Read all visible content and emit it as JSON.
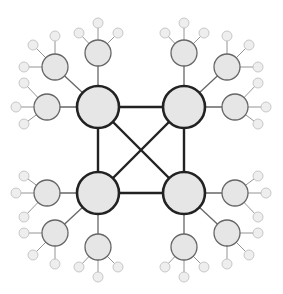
{
  "diagram": {
    "type": "hierarchical-network",
    "colors": {
      "background": "#ffffff",
      "node_fill": "#e6e6e6",
      "hub_stroke": "#222222",
      "satellite_stroke": "#666666",
      "leaf_stroke": "#bbbbbb",
      "leaf_fill": "#eeeeee"
    },
    "hubs": [
      {
        "id": "hub-tl",
        "x": 98,
        "y": 107
      },
      {
        "id": "hub-tr",
        "x": 184,
        "y": 107
      },
      {
        "id": "hub-bl",
        "x": 98,
        "y": 193
      },
      {
        "id": "hub-br",
        "x": 184,
        "y": 193
      }
    ],
    "hub_edges": [
      [
        "hub-tl",
        "hub-tr"
      ],
      [
        "hub-tl",
        "hub-bl"
      ],
      [
        "hub-tr",
        "hub-br"
      ],
      [
        "hub-bl",
        "hub-br"
      ],
      [
        "hub-tl",
        "hub-br"
      ],
      [
        "hub-tr",
        "hub-bl"
      ]
    ],
    "satellites": [
      {
        "id": "s-tl-1",
        "hub": "hub-tl",
        "x": 98,
        "y": 53,
        "leaves": [
          [
            98,
            23
          ],
          [
            79,
            33
          ],
          [
            118,
            33
          ]
        ]
      },
      {
        "id": "s-tl-2",
        "hub": "hub-tl",
        "x": 55,
        "y": 67,
        "leaves": [
          [
            55,
            36
          ],
          [
            33,
            45
          ],
          [
            24,
            67
          ]
        ]
      },
      {
        "id": "s-tl-3",
        "hub": "hub-tl",
        "x": 47,
        "y": 107,
        "leaves": [
          [
            24,
            83
          ],
          [
            16,
            107
          ],
          [
            24,
            124
          ]
        ]
      },
      {
        "id": "s-tr-1",
        "hub": "hub-tr",
        "x": 184,
        "y": 53,
        "leaves": [
          [
            184,
            23
          ],
          [
            165,
            33
          ],
          [
            204,
            33
          ]
        ]
      },
      {
        "id": "s-tr-2",
        "hub": "hub-tr",
        "x": 227,
        "y": 67,
        "leaves": [
          [
            227,
            36
          ],
          [
            249,
            45
          ],
          [
            258,
            67
          ]
        ]
      },
      {
        "id": "s-tr-3",
        "hub": "hub-tr",
        "x": 235,
        "y": 107,
        "leaves": [
          [
            258,
            83
          ],
          [
            266,
            107
          ],
          [
            258,
            124
          ]
        ]
      },
      {
        "id": "s-bl-1",
        "hub": "hub-bl",
        "x": 98,
        "y": 247,
        "leaves": [
          [
            98,
            277
          ],
          [
            79,
            267
          ],
          [
            118,
            267
          ]
        ]
      },
      {
        "id": "s-bl-2",
        "hub": "hub-bl",
        "x": 55,
        "y": 233,
        "leaves": [
          [
            55,
            264
          ],
          [
            33,
            255
          ],
          [
            24,
            233
          ]
        ]
      },
      {
        "id": "s-bl-3",
        "hub": "hub-bl",
        "x": 47,
        "y": 193,
        "leaves": [
          [
            24,
            217
          ],
          [
            16,
            193
          ],
          [
            24,
            176
          ]
        ]
      },
      {
        "id": "s-br-1",
        "hub": "hub-br",
        "x": 184,
        "y": 247,
        "leaves": [
          [
            184,
            277
          ],
          [
            165,
            267
          ],
          [
            204,
            267
          ]
        ]
      },
      {
        "id": "s-br-2",
        "hub": "hub-br",
        "x": 227,
        "y": 233,
        "leaves": [
          [
            227,
            264
          ],
          [
            249,
            255
          ],
          [
            258,
            233
          ]
        ]
      },
      {
        "id": "s-br-3",
        "hub": "hub-br",
        "x": 235,
        "y": 193,
        "leaves": [
          [
            258,
            217
          ],
          [
            266,
            193
          ],
          [
            258,
            176
          ]
        ]
      }
    ],
    "radii": {
      "hub": 21,
      "satellite": 13,
      "leaf": 5
    }
  }
}
